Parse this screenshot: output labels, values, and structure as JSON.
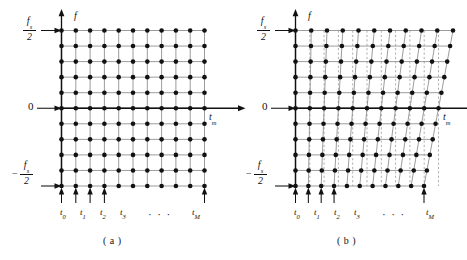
{
  "figure": {
    "background_color": "#ffffff",
    "ink_color": "#111111",
    "grid_line_color": "#8a8a8a",
    "dashed_line_color": "#9a9a9a",
    "dot_color": "#111111"
  },
  "panels": [
    {
      "id": "a",
      "caption": "( a )",
      "vertical_axis_name": "f",
      "horizontal_axis_name_base": "t",
      "horizontal_axis_name_sub": "m",
      "y_labels": {
        "top_numerator": "f",
        "top_numerator_sub": "s",
        "top_denominator": "2",
        "top_sign": "",
        "middle": "0",
        "bottom_numerator": "f",
        "bottom_numerator_sub": "s",
        "bottom_denominator": "2",
        "bottom_sign": "−"
      },
      "x_tick_labels": [
        "t",
        "t",
        "t",
        "t",
        "t"
      ],
      "x_tick_subs": [
        "0",
        "1",
        "2",
        "3",
        "M"
      ],
      "x_ellipsis": "· · ·",
      "grid": {
        "columns": 11,
        "rows": 11,
        "shear_per_column": 0,
        "dashed_reference_lines": false
      }
    },
    {
      "id": "b",
      "caption": "( b )",
      "vertical_axis_name": "f",
      "horizontal_axis_name_base": "t",
      "horizontal_axis_name_sub": "m",
      "y_labels": {
        "top_numerator": "f",
        "top_numerator_sub": "s",
        "top_denominator": "2",
        "top_sign": "",
        "middle": "0",
        "bottom_numerator": "f",
        "bottom_numerator_sub": "s",
        "bottom_denominator": "2",
        "bottom_sign": "−"
      },
      "x_tick_labels": [
        "t",
        "t",
        "t",
        "t",
        "t"
      ],
      "x_tick_subs": [
        "0",
        "1",
        "2",
        "3",
        "M"
      ],
      "x_ellipsis": "· · ·",
      "grid": {
        "columns": 11,
        "rows": 11,
        "shear_per_column": 1.45,
        "dashed_reference_lines": true
      }
    }
  ],
  "chart_data": {
    "type": "scatter",
    "title": "",
    "xlabel": "t_m",
    "ylabel": "f",
    "panels": [
      {
        "label": "( a )",
        "description": "Rectangular uniform time-frequency sampling lattice: 11 time columns x 11 frequency rows, all grid lines orthogonal.",
        "x_tick_labels": [
          "t0",
          "t1",
          "t2",
          "t3",
          "...",
          "tM"
        ],
        "y_tick_labels": [
          "fs/2",
          "0",
          "-fs/2"
        ],
        "ylim": [
          "-fs/2",
          "fs/2"
        ],
        "n_columns": 11,
        "n_rows": 11,
        "n_points": 121,
        "grid": true,
        "sheared": false
      },
      {
        "label": "( b )",
        "description": "Sheared (keystone) time-frequency sampling lattice: same 11 x 11 points, but each time column is progressively slanted relative to the dashed vertical reference lines.",
        "x_tick_labels": [
          "t0",
          "t1",
          "t2",
          "t3",
          "...",
          "tM"
        ],
        "y_tick_labels": [
          "fs/2",
          "0",
          "-fs/2"
        ],
        "ylim": [
          "-fs/2",
          "fs/2"
        ],
        "n_columns": 11,
        "n_rows": 11,
        "n_points": 121,
        "grid": true,
        "sheared": true
      }
    ]
  }
}
